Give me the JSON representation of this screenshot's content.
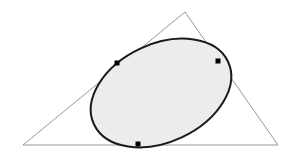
{
  "figure": {
    "canvas": {
      "width": 297,
      "height": 155,
      "background": "#ffffff"
    },
    "colors": {
      "triangle_stroke": "#8a8a8a",
      "ellipse_stroke": "#1a1a1a",
      "ellipse_fill": "#ececec",
      "tangent_point_fill": "#000000",
      "background": "#ffffff"
    },
    "triangle": {
      "name": "outer-triangle",
      "stroke_width": 0.9,
      "vertices": [
        {
          "label": "apex",
          "x": 185,
          "y": 12
        },
        {
          "label": "bottom-right",
          "x": 278,
          "y": 145
        },
        {
          "label": "bottom-left",
          "x": 23,
          "y": 145
        }
      ],
      "points_attr": "185,12 278,145 23,145"
    },
    "ellipse": {
      "name": "inscribed-ellipse",
      "center_x": 161,
      "center_y": 93,
      "radius_x": 74,
      "radius_y": 49,
      "rotation_deg": -25,
      "stroke_width": 2.0,
      "transform_attr": "rotate(-25 161 93)"
    },
    "tangent_points": [
      {
        "label": "tangency-left-edge",
        "x": 117,
        "y": 63,
        "size": 5
      },
      {
        "label": "tangency-right-edge",
        "x": 218,
        "y": 61,
        "size": 5
      },
      {
        "label": "tangency-bottom-edge",
        "x": 138,
        "y": 144,
        "size": 5
      }
    ]
  }
}
